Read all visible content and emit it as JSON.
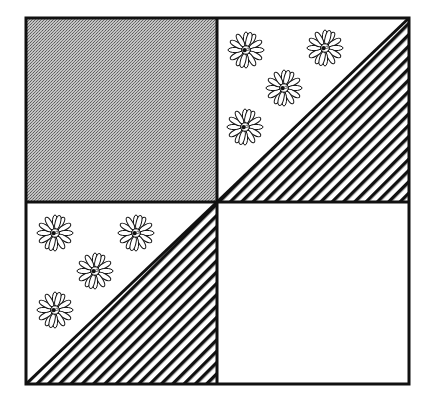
{
  "diagram": {
    "type": "quilt-block",
    "layout": "2x2 grid",
    "colors": {
      "stroke": "#111111",
      "background": "#ffffff",
      "gray_fill": "#a8a8a8"
    },
    "blocks": [
      {
        "position": "top-left",
        "kind": "solid",
        "fill": "gray-stipple"
      },
      {
        "position": "top-right",
        "kind": "half-square-triangle",
        "upper_left_triangle": "floral-print",
        "lower_right_triangle": "diagonal-stripes",
        "flower_count": 4
      },
      {
        "position": "bottom-left",
        "kind": "half-square-triangle",
        "upper_left_triangle": "floral-print",
        "lower_right_triangle": "diagonal-stripes",
        "flower_count": 4
      },
      {
        "position": "bottom-right",
        "kind": "solid",
        "fill": "white"
      }
    ]
  }
}
